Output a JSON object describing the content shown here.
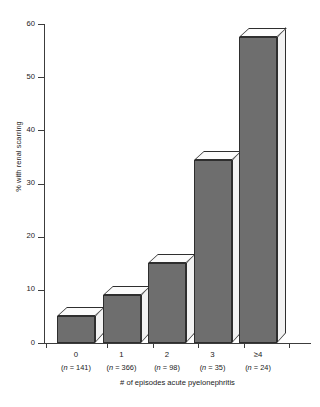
{
  "chart_data": {
    "type": "bar",
    "title": "",
    "xlabel": "# of episodes acute pyelonephritis",
    "ylabel": "% with renal scarring",
    "categories": [
      "0",
      "1",
      "2",
      "3",
      "≥4"
    ],
    "group_sizes": [
      "(n = 141)",
      "(n = 366)",
      "(n = 98)",
      "(n = 35)",
      "(n = 24)"
    ],
    "n_values": [
      141,
      366,
      98,
      35,
      24
    ],
    "values": [
      5,
      9,
      15,
      34.5,
      57.5
    ],
    "ylim": [
      0,
      60
    ],
    "ytick_labels": [
      "0",
      "10",
      "20",
      "30",
      "40",
      "50",
      "60"
    ],
    "ytick_values": [
      0,
      10,
      20,
      30,
      40,
      50,
      60
    ],
    "grid": false,
    "legend": "none",
    "style": "3d-bar",
    "colors": {
      "bar_front": "#6e6e6e",
      "bar_top": "#fbfbfb",
      "bar_side": "#f2f2f2",
      "outline": "#2e2e2e",
      "axis": "#3c3c3c",
      "text": "#1a1a1a",
      "background": "#ffffff"
    }
  }
}
